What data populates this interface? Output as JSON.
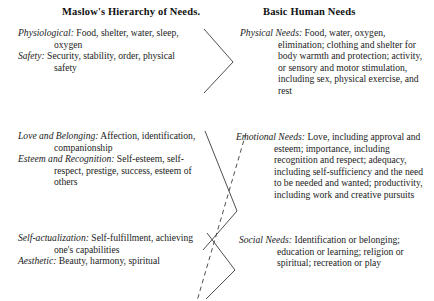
{
  "document": {
    "type": "two-column-comparison-table",
    "background": "#ffffff",
    "text_color": "#1b1b1b"
  },
  "columns": {
    "left": {
      "heading": "Maslow's Hierarchy of Needs",
      "heading_suffix": ".",
      "entries": [
        {
          "term": "Physiological:",
          "description": "Food, shelter, water, sleep, oxygen"
        },
        {
          "term": "Safety:",
          "description": "Security, stability, order, physical safety"
        },
        {
          "term": "Love and Belonging:",
          "description": "Affection, identification, companionship"
        },
        {
          "term": "Esteem and Recognition:",
          "description": "Self-esteem, self-respect, prestige, success, esteem of others"
        },
        {
          "term": "Self-actualization:",
          "description": "Self-fulfillment, achieving one's capabilities"
        },
        {
          "term": "Aesthetic:",
          "description": "Beauty, harmony, spiritual"
        }
      ]
    },
    "right": {
      "heading": "Basic Human Needs",
      "entries": [
        {
          "term": "Physical Needs:",
          "description": "Food, water, oxygen, elimination; clothing and shelter for body warmth and protection; activity, or sensory and motor stimulation, including sex, physical exercise, and rest"
        },
        {
          "term": "Emotional Needs:",
          "description": "Love, including approval and esteem; importance, including recognition and respect; adequacy, including self-sufficiency and the need to be needed and wanted; productivity, including work and creative pursuits"
        },
        {
          "term": "Social Needs:",
          "description": "Identification or belonging; education or learning; religion or spiritual; recreation or play"
        }
      ]
    }
  },
  "connectors": {
    "style_solid": "solid",
    "style_dashed": "dashed",
    "color": "#3a3a3a",
    "brackets": [
      {
        "name": "bracket-physiological-safety-to-physical",
        "points": "204,29 233,62 204,93"
      },
      {
        "name": "bracket-love-esteem-to-emotional",
        "points": "205,131 237,211 203,250"
      },
      {
        "name": "bracket-selfactualization-aesthetic-to-social",
        "points": "207,233 235,270 206,299"
      }
    ],
    "dashed_line": {
      "name": "dashed-crossing-line",
      "points": "246,133 197,301"
    }
  }
}
